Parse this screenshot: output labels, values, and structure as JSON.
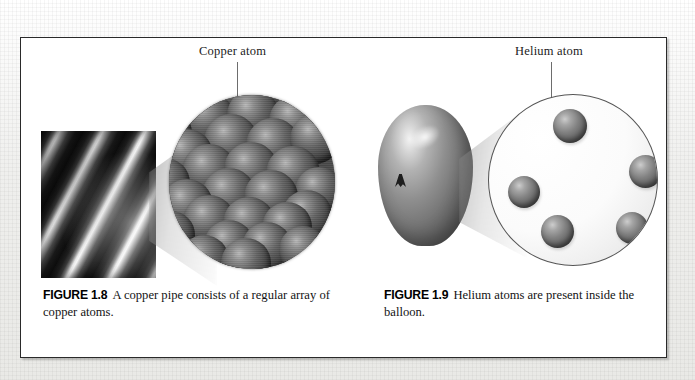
{
  "page": {
    "background_color": "#f2f2f0",
    "box_border_color": "#2a2a2a"
  },
  "figure_box": {
    "panels": [
      {
        "id": "copper",
        "callout": {
          "label": "Copper atom",
          "target": "copper-atom-sphere"
        },
        "photo": {
          "name": "copper-pipe-photograph",
          "description": "copper pipe"
        },
        "magnifier": {
          "name": "copper-magnified-circle",
          "contents": "close-packed array of copper atoms",
          "atom_count": 27
        },
        "caption": {
          "figure_number": "FIGURE 1.8",
          "text": "A copper pipe consists of a regular array of copper atoms."
        }
      },
      {
        "id": "helium",
        "callout": {
          "label": "Helium atom",
          "target": "helium-atom-sphere"
        },
        "photo": {
          "name": "balloon-illustration",
          "description": "inflated balloon"
        },
        "magnifier": {
          "name": "helium-magnified-circle",
          "contents": "widely separated helium atoms",
          "atom_count": 5
        },
        "caption": {
          "figure_number": "FIGURE 1.9",
          "text": "Helium atoms are present inside the balloon."
        }
      }
    ]
  },
  "colors": {
    "atom_dark": "#454545",
    "atom_mid": "#808080",
    "atom_light": "#cdcdcd",
    "circle_outline": "#555555",
    "leader_line": "#6d6d6d",
    "caption_text": "#131313"
  },
  "copper_atoms": [
    {
      "x": 62,
      "y": -8,
      "r": 25
    },
    {
      "x": 106,
      "y": -12,
      "r": 25
    },
    {
      "x": 18,
      "y": 6,
      "r": 25
    },
    {
      "x": 140,
      "y": 4,
      "r": 25
    },
    {
      "x": 40,
      "y": 24,
      "r": 26
    },
    {
      "x": 84,
      "y": 20,
      "r": 26
    },
    {
      "x": 126,
      "y": 26,
      "r": 26
    },
    {
      "x": -2,
      "y": 38,
      "r": 25
    },
    {
      "x": 62,
      "y": 46,
      "r": 27
    },
    {
      "x": 104,
      "y": 50,
      "r": 27
    },
    {
      "x": 146,
      "y": 44,
      "r": 25
    },
    {
      "x": 18,
      "y": 60,
      "r": 26
    },
    {
      "x": 40,
      "y": 76,
      "r": 27
    },
    {
      "x": 82,
      "y": 74,
      "r": 27
    },
    {
      "x": 124,
      "y": 78,
      "r": 27
    },
    {
      "x": -4,
      "y": 88,
      "r": 25
    },
    {
      "x": 150,
      "y": 96,
      "r": 24
    },
    {
      "x": 60,
      "y": 100,
      "r": 27
    },
    {
      "x": 102,
      "y": 102,
      "r": 27
    },
    {
      "x": 18,
      "y": 110,
      "r": 26
    },
    {
      "x": 138,
      "y": 120,
      "r": 25
    },
    {
      "x": 40,
      "y": 126,
      "r": 26
    },
    {
      "x": 80,
      "y": 128,
      "r": 26
    },
    {
      "x": 118,
      "y": 132,
      "r": 25
    },
    {
      "x": 2,
      "y": 140,
      "r": 24
    },
    {
      "x": 60,
      "y": 150,
      "r": 25
    },
    {
      "x": 98,
      "y": 152,
      "r": 25
    }
  ],
  "helium_atoms": [
    {
      "x": 64,
      "y": 14,
      "d": 34
    },
    {
      "x": 19,
      "y": 81,
      "d": 32
    },
    {
      "x": 52,
      "y": 120,
      "d": 33
    },
    {
      "x": 127,
      "y": 117,
      "d": 32
    },
    {
      "x": 140,
      "y": 60,
      "d": 33
    }
  ]
}
